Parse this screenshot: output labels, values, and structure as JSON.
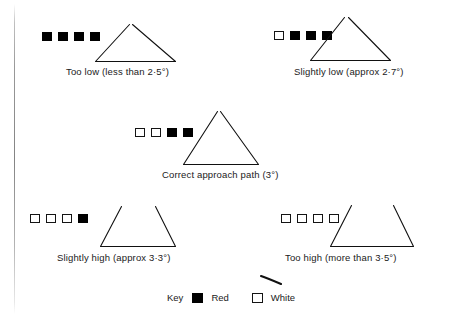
{
  "figure": {
    "ink_color": "#111111",
    "background": "#ffffff"
  },
  "panels": [
    {
      "id": "too-low",
      "caption": "Too low (less than 2·5°)",
      "lights": [
        "red",
        "red",
        "red",
        "red"
      ],
      "shape": "wide-flat-triangle",
      "angle_text": "less than 2·5°"
    },
    {
      "id": "slightly-low",
      "caption": "Slightly low (approx 2·7°)",
      "lights": [
        "white",
        "red",
        "red",
        "red"
      ],
      "shape": "wide-triangle",
      "angle_text": "approx 2·7°"
    },
    {
      "id": "correct",
      "caption": "Correct approach path (3°)",
      "lights": [
        "white",
        "white",
        "red",
        "red"
      ],
      "shape": "triangle",
      "angle_text": "3°"
    },
    {
      "id": "slightly-high",
      "caption": "Slightly high (approx 3·3°)",
      "lights": [
        "white",
        "white",
        "white",
        "red"
      ],
      "shape": "trapezoid",
      "angle_text": "approx 3·3°"
    },
    {
      "id": "too-high",
      "caption": "Too high (more than 3·5°)",
      "lights": [
        "white",
        "white",
        "white",
        "white"
      ],
      "shape": "wide-trapezoid",
      "angle_text": "more than 3·5°"
    }
  ],
  "legend": {
    "title": "Key",
    "entries": [
      {
        "swatch": "red",
        "label": "Red"
      },
      {
        "swatch": "white",
        "label": "White"
      }
    ]
  }
}
